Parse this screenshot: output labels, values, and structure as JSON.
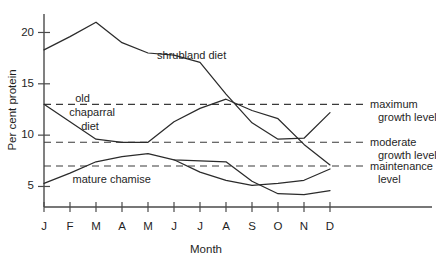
{
  "chart_data": {
    "type": "line",
    "title": "",
    "xlabel": "Month",
    "ylabel": "Per cent protein",
    "categories": [
      "J",
      "F",
      "M",
      "A",
      "M",
      "J",
      "J",
      "A",
      "S",
      "O",
      "N",
      "D"
    ],
    "xlim": [
      0,
      11
    ],
    "ylim": [
      3.0,
      21.8
    ],
    "ytick_values": [
      5,
      10,
      15,
      20
    ],
    "ytick_labels": [
      "5",
      "10",
      "15",
      "20"
    ],
    "grid": false,
    "legend": "inline-annotations",
    "series": [
      {
        "name": "shrubland diet",
        "label": "shrubland diet",
        "label_point": {
          "x": 4.35,
          "y": 17.4
        },
        "values": [
          18.3,
          19.6,
          21.0,
          19.0,
          18.0,
          17.8,
          17.1,
          14.0,
          11.2,
          9.6,
          9.7,
          12.2
        ]
      },
      {
        "name": "old chaparral diet",
        "label": "old\nchaparral\ndiet",
        "label_lines": [
          "old",
          "chaparral",
          "diet"
        ],
        "label_point": {
          "x": 1.2,
          "y": 13.2
        },
        "values": [
          13.0,
          11.3,
          9.6,
          9.3,
          9.3,
          11.3,
          12.6,
          13.5,
          12.4,
          11.6,
          9.1,
          7.1
        ]
      },
      {
        "name": "mature chamise",
        "label": "mature chamise",
        "label_point": {
          "x": 1.1,
          "y": 5.3
        },
        "values": [
          5.3,
          6.3,
          7.4,
          7.9,
          8.2,
          7.6,
          7.5,
          7.4,
          5.5,
          4.3,
          4.2,
          4.6
        ]
      },
      {
        "name": "mature chamise second branch",
        "label": "",
        "values": [
          null,
          null,
          null,
          null,
          null,
          7.6,
          6.4,
          5.6,
          5.1,
          5.3,
          5.6,
          6.7
        ]
      }
    ],
    "reference_lines": [
      {
        "name": "maximum growth level",
        "value": 13.0,
        "label_lines": [
          "maximum",
          "growth level"
        ],
        "style": "dashed"
      },
      {
        "name": "moderate growth level",
        "value": 9.3,
        "label_lines": [
          "moderate",
          "growth level"
        ],
        "style": "dashed"
      },
      {
        "name": "maintenance level",
        "value": 7.0,
        "label_lines": [
          "maintenance",
          "level"
        ],
        "style": "dashed"
      }
    ],
    "colors": {
      "series_stroke": "#2b2b2b",
      "reference_stroke": "#3a3a3a",
      "axis": "#4a4a4a",
      "text": "#1f1f1f",
      "background": "#ffffff"
    }
  }
}
